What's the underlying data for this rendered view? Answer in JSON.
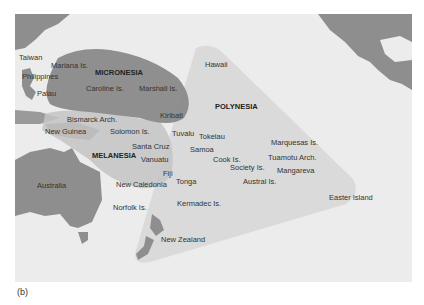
{
  "figure": {
    "caption": "(b)",
    "colors": {
      "ocean": "#ececec",
      "land": "#8e8e8e",
      "micronesia": "#8a8a8a",
      "melanesia": "#c4c4c4",
      "polynesia": "#d8d8d8",
      "text": "#333333"
    },
    "regions": [
      {
        "name": "MICRONESIA",
        "x": 95,
        "y": 69
      },
      {
        "name": "POLYNESIA",
        "x": 215,
        "y": 103
      },
      {
        "name": "MELANESIA",
        "x": 92,
        "y": 152
      }
    ],
    "places": [
      {
        "name": "Taiwan",
        "x": 19,
        "y": 54
      },
      {
        "name": "Mariana Is.",
        "x": 51,
        "y": 62
      },
      {
        "name": "Philippines",
        "x": 22,
        "y": 73
      },
      {
        "name": "Palau",
        "x": 37,
        "y": 90
      },
      {
        "name": "Caroline Is.",
        "x": 86,
        "y": 85
      },
      {
        "name": "Marshall Is.",
        "x": 139,
        "y": 85
      },
      {
        "name": "Hawaii",
        "x": 205,
        "y": 61
      },
      {
        "name": "Kiribati",
        "x": 160,
        "y": 112
      },
      {
        "name": "Bismarck Arch.",
        "x": 67,
        "y": 116
      },
      {
        "name": "New Guinea",
        "x": 45,
        "y": 128
      },
      {
        "name": "Solomon Is.",
        "x": 110,
        "y": 128
      },
      {
        "name": "Tuvalu",
        "x": 172,
        "y": 130
      },
      {
        "name": "Tokelau",
        "x": 199,
        "y": 133
      },
      {
        "name": "Santa Cruz",
        "x": 132,
        "y": 143
      },
      {
        "name": "Samoa",
        "x": 190,
        "y": 146
      },
      {
        "name": "Marquesas Is.",
        "x": 271,
        "y": 139
      },
      {
        "name": "Vanuatu",
        "x": 141,
        "y": 156
      },
      {
        "name": "Cook Is.",
        "x": 213,
        "y": 156
      },
      {
        "name": "Tuamotu Arch.",
        "x": 268,
        "y": 154
      },
      {
        "name": "Society Is.",
        "x": 230,
        "y": 164
      },
      {
        "name": "Mangareva",
        "x": 277,
        "y": 167
      },
      {
        "name": "Fiji",
        "x": 163,
        "y": 170
      },
      {
        "name": "Australia",
        "x": 37,
        "y": 182
      },
      {
        "name": "New Caledonia",
        "x": 116,
        "y": 181
      },
      {
        "name": "Tonga",
        "x": 176,
        "y": 178
      },
      {
        "name": "Austral Is.",
        "x": 243,
        "y": 178
      },
      {
        "name": "Easter Island",
        "x": 329,
        "y": 194
      },
      {
        "name": "Norfolk Is.",
        "x": 113,
        "y": 204
      },
      {
        "name": "Kermadec Is.",
        "x": 177,
        "y": 200
      },
      {
        "name": "New Zealand",
        "x": 161,
        "y": 236
      }
    ]
  }
}
